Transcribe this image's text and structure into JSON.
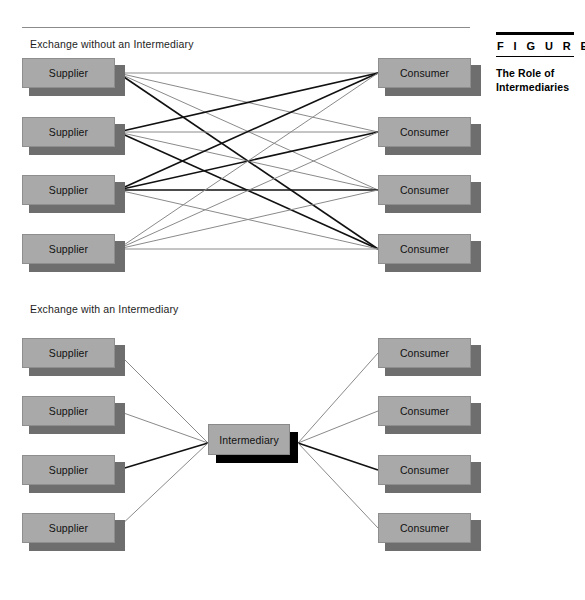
{
  "figure": {
    "kicker": "F I G U R E",
    "title": "The Role of\nIntermediaries",
    "title_line1": "The Role of",
    "title_line2": "Intermediaries"
  },
  "sections": [
    {
      "id": "without",
      "label": "Exchange without an Intermediary"
    },
    {
      "id": "with",
      "label": "Exchange with an Intermediary"
    }
  ],
  "labels": {
    "supplier": "Supplier",
    "consumer": "Consumer",
    "intermediary": "Intermediary"
  },
  "colors": {
    "box_face": "#a9a9a9",
    "box_shadow": "#6e6e6e",
    "intermediary_shadow": "#000000",
    "line_light": "#8a8a8a",
    "line_dark": "#111111",
    "rule": "#8c8c8c",
    "background": "#ffffff"
  },
  "diagram_top": {
    "suppliers": [
      {
        "label": "Supplier",
        "x": 22,
        "y": 58
      },
      {
        "label": "Supplier",
        "x": 22,
        "y": 117
      },
      {
        "label": "Supplier",
        "x": 22,
        "y": 175
      },
      {
        "label": "Supplier",
        "x": 22,
        "y": 234
      }
    ],
    "consumers": [
      {
        "label": "Consumer",
        "x": 378,
        "y": 58
      },
      {
        "label": "Consumer",
        "x": 378,
        "y": 117
      },
      {
        "label": "Consumer",
        "x": 378,
        "y": 175
      },
      {
        "label": "Consumer",
        "x": 378,
        "y": 234
      }
    ],
    "connection_count": 16,
    "pattern": "full-mesh 4x4",
    "dark_links": [
      [
        3,
        1
      ],
      [
        3,
        2
      ],
      [
        3,
        3
      ],
      [
        2,
        1
      ],
      [
        1,
        4
      ],
      [
        2,
        4
      ]
    ]
  },
  "diagram_bottom": {
    "suppliers": [
      {
        "label": "Supplier",
        "x": 22,
        "y": 338
      },
      {
        "label": "Supplier",
        "x": 22,
        "y": 396
      },
      {
        "label": "Supplier",
        "x": 22,
        "y": 455
      },
      {
        "label": "Supplier",
        "x": 22,
        "y": 513
      }
    ],
    "consumers": [
      {
        "label": "Consumer",
        "x": 378,
        "y": 338
      },
      {
        "label": "Consumer",
        "x": 378,
        "y": 396
      },
      {
        "label": "Consumer",
        "x": 378,
        "y": 455
      },
      {
        "label": "Consumer",
        "x": 378,
        "y": 513
      }
    ],
    "intermediary": {
      "label": "Intermediary",
      "x": 208,
      "y": 424
    },
    "connection_count": 8,
    "pattern": "hub-and-spoke",
    "dark_links": [
      3
    ]
  }
}
